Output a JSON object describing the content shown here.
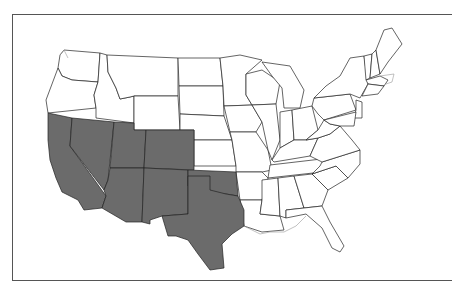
{
  "map": {
    "title": "United States map with highlighted Southwestern states",
    "highlight_color": "#6b6b6b",
    "base_color": "#ffffff",
    "border_color": "#222222",
    "highlighted_states": [
      "California",
      "Nevada",
      "Utah",
      "Colorado",
      "Arizona",
      "New Mexico",
      "Oklahoma",
      "Texas"
    ]
  }
}
